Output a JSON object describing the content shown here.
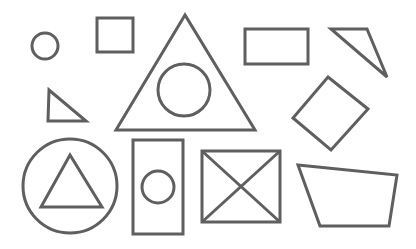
{
  "canvas": {
    "width": 416,
    "height": 249,
    "background": "#ffffff",
    "stroke_color": "#5f5f5f",
    "stroke_width": 3
  },
  "shapes": [
    {
      "name": "small-circle",
      "type": "circle",
      "cx": 45,
      "cy": 46,
      "r": 13
    },
    {
      "name": "small-square",
      "type": "rect",
      "x": 97,
      "y": 18,
      "w": 36,
      "h": 34
    },
    {
      "name": "large-triangle",
      "type": "polygon",
      "points": "185,15 116,130 255,130"
    },
    {
      "name": "circle-in-large-triangle",
      "type": "circle",
      "cx": 184,
      "cy": 90,
      "r": 26
    },
    {
      "name": "wide-rectangle",
      "type": "rect",
      "x": 245,
      "y": 29,
      "w": 63,
      "h": 35
    },
    {
      "name": "right-triangle-top-right",
      "type": "polygon",
      "points": "331,29 367,29 387,77"
    },
    {
      "name": "small-triangle-left",
      "type": "polygon",
      "points": "49,90 48,121 86,121"
    },
    {
      "name": "diamond",
      "type": "polygon",
      "points": "328,77 368,109 331,150 293,118"
    },
    {
      "name": "large-circle",
      "type": "circle",
      "cx": 70,
      "cy": 186,
      "r": 47
    },
    {
      "name": "triangle-in-large-circle",
      "type": "polygon",
      "points": "70,155 41,207 102,207"
    },
    {
      "name": "tall-rectangle",
      "type": "rect",
      "x": 133,
      "y": 140,
      "w": 50,
      "h": 94
    },
    {
      "name": "circle-in-tall-rectangle",
      "type": "circle",
      "cx": 158,
      "cy": 187,
      "r": 16
    },
    {
      "name": "crossed-box",
      "type": "rect",
      "x": 202,
      "y": 151,
      "w": 78,
      "h": 71
    },
    {
      "name": "crossed-box-diagonal-1",
      "type": "line",
      "x1": 202,
      "y1": 151,
      "x2": 280,
      "y2": 222
    },
    {
      "name": "crossed-box-diagonal-2",
      "type": "line",
      "x1": 280,
      "y1": 151,
      "x2": 202,
      "y2": 222
    },
    {
      "name": "trapezoid",
      "type": "polygon",
      "points": "298,165 397,175 389,226 320,226"
    }
  ]
}
